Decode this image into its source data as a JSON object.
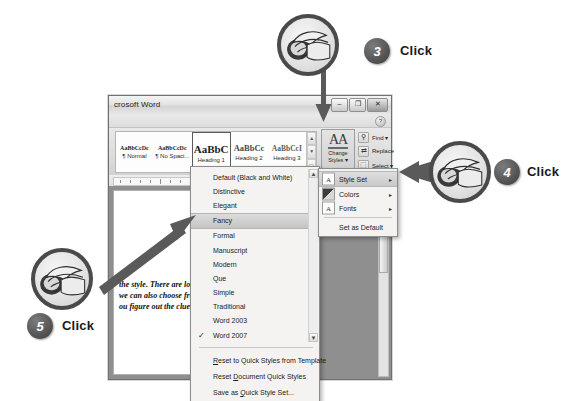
{
  "window": {
    "title": "crosoft Word",
    "controls": [
      {
        "name": "minimize",
        "glyph": "–"
      },
      {
        "name": "restore",
        "glyph": "❐"
      },
      {
        "name": "close",
        "glyph": "✕"
      }
    ],
    "help_glyph": "?"
  },
  "ribbon": {
    "gallery": [
      {
        "sample": "AaBbCcDc",
        "label": "¶ Normal",
        "selected": false
      },
      {
        "sample": "AaBbCcDc",
        "label": "¶ No Spaci...",
        "selected": false
      },
      {
        "sample": "AaBbC",
        "label": "Heading 1",
        "selected": true
      },
      {
        "sample": "AaBbCc",
        "label": "Heading 2",
        "selected": false
      },
      {
        "sample": "AaBbCcI",
        "label": "Heading 3",
        "selected": false
      }
    ],
    "gallery_scroll": [
      "▲",
      "▼",
      "▭"
    ],
    "change_styles": {
      "icon_text": "AA",
      "line1": "Change",
      "line2": "Styles ▾"
    },
    "editing": [
      {
        "label": "Find ▾",
        "icon": "🔍",
        "icon_name": "find-icon"
      },
      {
        "label": "Replace",
        "icon": "⇄",
        "icon_name": "replace-icon"
      },
      {
        "label": "Select ▾",
        "icon": "⬚",
        "icon_name": "select-icon"
      }
    ]
  },
  "document": {
    "lines": [
      "the style. There are lo",
      "we can also choose fro",
      "ou figure out the clues"
    ]
  },
  "dropdown": {
    "items": [
      {
        "label": "Default (Black and White)",
        "checked": false,
        "highlighted": false
      },
      {
        "label": "Distinctive",
        "checked": false,
        "highlighted": false
      },
      {
        "label": "Elegant",
        "checked": false,
        "highlighted": false
      },
      {
        "label": "Fancy",
        "checked": false,
        "highlighted": true
      },
      {
        "label": "Formal",
        "checked": false,
        "highlighted": false
      },
      {
        "label": "Manuscript",
        "checked": false,
        "highlighted": false
      },
      {
        "label": "Modern",
        "checked": false,
        "highlighted": false
      },
      {
        "label": "Que",
        "checked": false,
        "highlighted": false
      },
      {
        "label": "Simple",
        "checked": false,
        "highlighted": false
      },
      {
        "label": "Traditional",
        "checked": false,
        "highlighted": false
      },
      {
        "label": "Word 2003",
        "checked": false,
        "highlighted": false
      },
      {
        "label": "Word 2007",
        "checked": true,
        "highlighted": false
      }
    ],
    "check_glyph": "✓",
    "scroll_up": "▲",
    "scroll_down": "▼",
    "commands": [
      {
        "pre": "",
        "accel": "R",
        "post": "eset to Quick Styles from Template"
      },
      {
        "pre": "Reset ",
        "accel": "D",
        "post": "ocument Quick Styles"
      },
      {
        "pre": "Save as ",
        "accel": "Q",
        "post": "uick Style Set..."
      }
    ],
    "grip": "• • • •"
  },
  "submenu": {
    "items": [
      {
        "label": "Style Set",
        "icon": "A",
        "icon_name": "style-set-icon",
        "arrow": "▸",
        "active": true
      },
      {
        "label": "Colors",
        "icon": "",
        "icon_name": "colors-icon",
        "arrow": "▸",
        "active": false
      },
      {
        "label": "Fonts",
        "icon": "A",
        "icon_name": "fonts-icon",
        "arrow": "▸",
        "active": false
      },
      {
        "label": "Set as Default",
        "icon": "",
        "icon_name": "",
        "arrow": "",
        "active": false
      }
    ]
  },
  "callouts": [
    {
      "number": "3",
      "action": "Click"
    },
    {
      "number": "4",
      "action": "Click"
    },
    {
      "number": "5",
      "action": "Click"
    }
  ],
  "colors": {
    "badge": "#4a4a4a",
    "ring": "#4a4a4a",
    "arrow": "#5a5a5a",
    "highlight": "#cccccc"
  }
}
